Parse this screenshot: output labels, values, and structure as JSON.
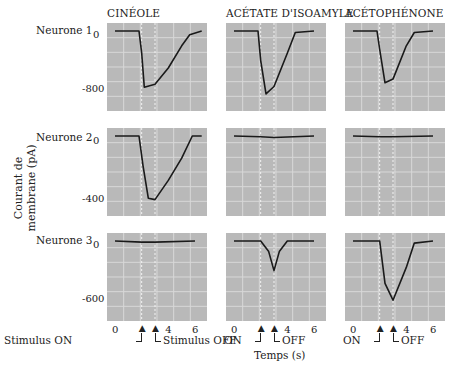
{
  "figure": {
    "columns": [
      "CINÉOLE",
      "ACÉTATE D'ISOAMYLE",
      "ACÉTOPHÉNONE"
    ],
    "rows": [
      "Neurone 1",
      "Neurone 2",
      "Neurone 3"
    ],
    "y_axis_label_line1": "Courant de",
    "y_axis_label_line2": "membrane (pA)",
    "x_axis_label": "Temps (s)",
    "x_ticks": [
      "0",
      "4",
      "6"
    ],
    "row_ticks": [
      {
        "top": "0",
        "bottom": "-800"
      },
      {
        "top": "0",
        "bottom": "-400"
      },
      {
        "top": "0",
        "bottom": "-600"
      }
    ],
    "stimulus_on_label": "Stimulus ON",
    "stimulus_off_label": "Stimulus OFF",
    "on_label": "ON",
    "off_label": "OFF",
    "colors": {
      "panel_bg": "#b9b9b9",
      "grid": "#d8d8d8",
      "trace": "#1a1a1a"
    }
  },
  "chart_data": {
    "type": "line",
    "xlabel": "Temps (s)",
    "ylabel": "Courant de membrane (pA)",
    "xlim": [
      -0.5,
      7
    ],
    "stimulus": {
      "on_s": 2,
      "off_s": 3
    },
    "grid": true,
    "panels": [
      {
        "neuron": "Neurone 1",
        "odorant": "CINÉOLE",
        "ylim": [
          -1000,
          100
        ],
        "x": [
          0,
          1.8,
          2.0,
          2.2,
          3.0,
          4.0,
          5.0,
          5.6,
          6.5
        ],
        "y": [
          0,
          0,
          -300,
          -760,
          -720,
          -500,
          -200,
          -50,
          0
        ]
      },
      {
        "neuron": "Neurone 1",
        "odorant": "ACÉTATE D'ISOAMYLE",
        "ylim": [
          -1000,
          100
        ],
        "x": [
          0,
          1.8,
          2.0,
          2.4,
          3.0,
          4.0,
          4.6,
          6.0
        ],
        "y": [
          0,
          0,
          -400,
          -850,
          -750,
          -300,
          -20,
          0
        ]
      },
      {
        "neuron": "Neurone 1",
        "odorant": "ACÉTOPHÉNONE",
        "ylim": [
          -1000,
          100
        ],
        "x": [
          0,
          1.8,
          2.0,
          2.4,
          3.0,
          4.0,
          4.6,
          6.0
        ],
        "y": [
          0,
          0,
          -250,
          -700,
          -650,
          -200,
          -20,
          0
        ]
      },
      {
        "neuron": "Neurone 2",
        "odorant": "CINÉOLE",
        "ylim": [
          -500,
          50
        ],
        "x": [
          0,
          1.8,
          2.1,
          2.5,
          3.0,
          4.0,
          5.0,
          5.8,
          6.5
        ],
        "y": [
          0,
          0,
          -200,
          -420,
          -430,
          -300,
          -150,
          0,
          0
        ]
      },
      {
        "neuron": "Neurone 2",
        "odorant": "ACÉTATE D'ISOAMYLE",
        "ylim": [
          -500,
          50
        ],
        "x": [
          0,
          2.0,
          3.0,
          6.0
        ],
        "y": [
          0,
          -5,
          -10,
          0
        ]
      },
      {
        "neuron": "Neurone 2",
        "odorant": "ACÉTOPHÉNONE",
        "ylim": [
          -500,
          50
        ],
        "x": [
          0,
          2.0,
          3.0,
          6.0
        ],
        "y": [
          0,
          -5,
          -5,
          0
        ]
      },
      {
        "neuron": "Neurone 3",
        "odorant": "CINÉOLE",
        "ylim": [
          -700,
          50
        ],
        "x": [
          0,
          2.0,
          3.0,
          6.0
        ],
        "y": [
          0,
          -10,
          -10,
          0
        ]
      },
      {
        "neuron": "Neurone 3",
        "odorant": "ACÉTATE D'ISOAMYLE",
        "ylim": [
          -700,
          50
        ],
        "x": [
          0,
          2.0,
          2.6,
          3.0,
          3.4,
          4.0,
          6.0
        ],
        "y": [
          0,
          0,
          -100,
          -280,
          -100,
          0,
          0
        ]
      },
      {
        "neuron": "Neurone 3",
        "odorant": "ACÉTOPHÉNONE",
        "ylim": [
          -700,
          50
        ],
        "x": [
          0,
          2.0,
          2.4,
          3.0,
          4.0,
          4.6,
          6.0
        ],
        "y": [
          0,
          0,
          -400,
          -560,
          -250,
          -20,
          0
        ]
      }
    ]
  }
}
